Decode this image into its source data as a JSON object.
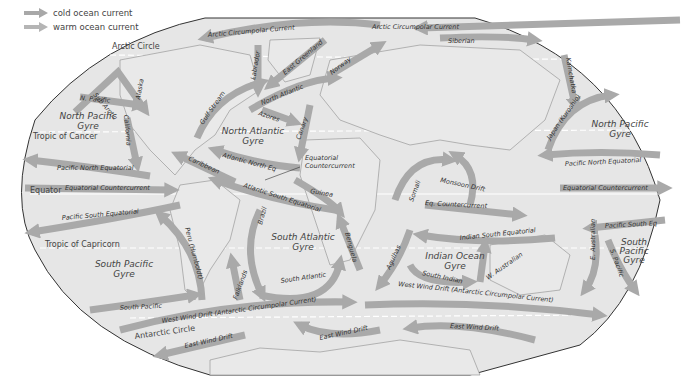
{
  "legend": {
    "cold_label": "cold ocean current",
    "warm_label": "warm ocean current",
    "cold_color": "#a8a8a8",
    "warm_color": "#b5b5b5"
  },
  "colors": {
    "ocean": "#e6e6e6",
    "land_outline": "#9a9a9a",
    "arrow": "#a9a9a9",
    "border": "#333333",
    "latitude_lines": "#ffffff"
  },
  "reference_lines": {
    "arctic_circle": "Arctic Circle",
    "tropic_cancer": "Tropic of Cancer",
    "equator": "Equator",
    "tropic_capricorn": "Tropic of Capricorn",
    "antarctic_circle": "Antarctic Circle"
  },
  "gyres": {
    "north_pacific_west": [
      "North Pacific",
      "Gyre"
    ],
    "north_atlantic": [
      "North Atlantic",
      "Gyre"
    ],
    "north_pacific_east": [
      "North Pacific",
      "Gyre"
    ],
    "south_pacific_west": [
      "South Pacific",
      "Gyre"
    ],
    "south_atlantic": [
      "South Atlantic",
      "Gyre"
    ],
    "indian_ocean": [
      "Indian Ocean",
      "Gyre"
    ],
    "south_pacific_east": [
      "South",
      "Pacific",
      "Gyre"
    ]
  },
  "currents": {
    "arctic_circumpolar_1": "Arctic Circumpolar Current",
    "arctic_circumpolar_2": "Arctic Circumpolar Current",
    "siberian": "Siberian",
    "labrador": "Labrador",
    "east_greenland": "East Greenland",
    "norway": "Norway",
    "north_atlantic": "North Atlantic",
    "gulf_stream": "Gulf Stream",
    "azores": "Azores",
    "canary": "Canary",
    "atlantic_north_eq": "Atlantic North Eq",
    "equatorial_countercurrent_callout": [
      "Equatorial",
      "Countercurrent"
    ],
    "caribbean": "Caribbean",
    "guinea": "Guinea",
    "atlantic_south_equatorial": "Atlantic South Equatorial",
    "sub_arctic": "Sub Arctic",
    "alaska": "Alaska",
    "n_pacific": "N. Pacific",
    "california": "California",
    "pacific_north_equatorial_w": "Pacific North Equatorial",
    "equatorial_countercurrent_w": "Equatorial Countercurrent",
    "pacific_south_equatorial": "Pacific South Equatorial",
    "peru": "Peru (Humboldt)",
    "brazil": "Brazil",
    "benguela": "Benguela",
    "south_atlantic": "South Atlantic",
    "falklands": "Falklands",
    "south_pacific": "South Pacific",
    "west_wind_drift_w": "West Wind Drift (Antarctic Circumpolar Current)",
    "west_wind_drift_e": "West Wind Drift (Antarctic Circumpolar Current)",
    "east_wind_drift_1": "East Wind Drift",
    "east_wind_drift_2": "East Wind Drift",
    "east_wind_drift_3": "East Wind Drift",
    "somali": "Somali",
    "monsoon_drift": "Monsoon Drift",
    "eq_countercurrent_indian": "Eq. Countercurrent",
    "indian_south_equatorial": "Indian South Equatorial",
    "agulhas": "Agulhas",
    "south_indian": "South Indian",
    "w_australian": "W. Australian",
    "kamchatka": "Kamchatka",
    "japan_kuroshio": "Japan (Kuroshio)",
    "pacific_north_equatorial_e": "Pacific North Equatorial",
    "equatorial_countercurrent_e": "Equatorial Countercurrent",
    "pacific_south_eq_e": "Pacific South Eq",
    "e_australian": "E. Australian",
    "s_pacific": "S. Pacific"
  }
}
